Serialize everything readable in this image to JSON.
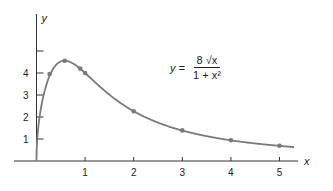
{
  "chart_data": {
    "type": "line",
    "title": "",
    "equation": {
      "lhs": "y =",
      "numerator": "8 √x",
      "denominator": "1 + x²"
    },
    "xlabel": "x",
    "ylabel": "y",
    "xlim": [
      0,
      5.3
    ],
    "ylim": [
      0,
      6
    ],
    "grid": false,
    "legend": "none",
    "x_ticks": [
      1,
      2,
      3,
      4,
      5
    ],
    "y_ticks": [
      1,
      2,
      3,
      4,
      5
    ],
    "x_tick_labels": [
      "1",
      "2",
      "3",
      "4",
      "5"
    ],
    "y_tick_labels": [
      "1",
      "2",
      "3",
      "4",
      ""
    ],
    "series": [
      {
        "name": "y = 8√x / (1 + x²)",
        "kind": "curve",
        "function": "8*sqrt(x)/(1+x*x)",
        "x_range": [
          0,
          5.3
        ]
      },
      {
        "name": "marked points",
        "kind": "points",
        "x": [
          0.27,
          0.58,
          0.9,
          1,
          2,
          3,
          4,
          5
        ],
        "y": [
          3.95,
          4.56,
          4.2,
          4.0,
          2.26,
          1.39,
          0.94,
          0.69
        ]
      }
    ],
    "colors": {
      "curve": "#7a7a7a",
      "points": "#7a7a7a",
      "axes": "#333333"
    }
  }
}
